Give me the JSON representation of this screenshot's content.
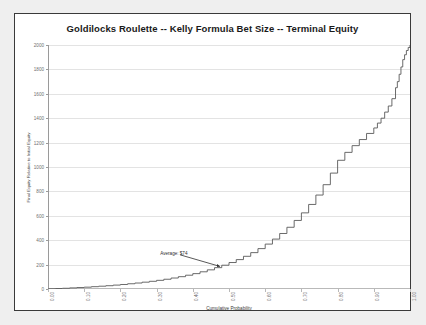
{
  "chart_data": {
    "type": "line",
    "title": "Goldilocks Roulette -- Kelly Formula Bet Size -- Terminal Equity",
    "xlabel": "Cumulative Probability",
    "ylabel": "Final Equity Relative to Initial Equity",
    "xlim": [
      0.0,
      1.0
    ],
    "ylim": [
      0,
      2000
    ],
    "grid": true,
    "legend_position": "none",
    "xtick_labels": [
      "0.00",
      "0.10",
      "0.20",
      "0.30",
      "0.40",
      "0.50",
      "0.60",
      "0.70",
      "0.80",
      "0.90",
      "1.00"
    ],
    "xtick_values": [
      0.0,
      0.1,
      0.2,
      0.3,
      0.4,
      0.5,
      0.6,
      0.7,
      0.8,
      0.9,
      1.0
    ],
    "ytick_labels": [
      "0",
      "200",
      "400",
      "600",
      "800",
      "1000",
      "1200",
      "1400",
      "1600",
      "1800",
      "2000"
    ],
    "ytick_values": [
      0,
      200,
      400,
      600,
      800,
      1000,
      1200,
      1400,
      1600,
      1800,
      2000
    ],
    "series": [
      {
        "name": "Terminal Equity",
        "x": [
          0.0,
          0.02,
          0.04,
          0.06,
          0.08,
          0.1,
          0.12,
          0.14,
          0.16,
          0.18,
          0.2,
          0.22,
          0.24,
          0.26,
          0.28,
          0.3,
          0.32,
          0.34,
          0.36,
          0.38,
          0.4,
          0.42,
          0.44,
          0.46,
          0.48,
          0.5,
          0.52,
          0.54,
          0.56,
          0.58,
          0.6,
          0.62,
          0.64,
          0.66,
          0.68,
          0.7,
          0.72,
          0.74,
          0.76,
          0.78,
          0.8,
          0.82,
          0.84,
          0.86,
          0.88,
          0.9,
          0.91,
          0.92,
          0.93,
          0.94,
          0.95,
          0.96,
          0.965,
          0.97,
          0.975,
          0.98,
          0.985,
          0.99,
          0.995,
          1.0
        ],
        "y": [
          2,
          4,
          6,
          9,
          12,
          15,
          19,
          23,
          27,
          32,
          37,
          43,
          49,
          56,
          63,
          71,
          80,
          90,
          101,
          113,
          126,
          141,
          157,
          175,
          195,
          217,
          241,
          268,
          298,
          331,
          368,
          409,
          455,
          506,
          562,
          624,
          693,
          770,
          855,
          950,
          1055,
          1120,
          1175,
          1225,
          1275,
          1320,
          1360,
          1400,
          1450,
          1500,
          1560,
          1650,
          1700,
          1760,
          1820,
          1880,
          1920,
          1955,
          1980,
          2000
        ]
      }
    ],
    "annotations": [
      {
        "label": "Average: $74",
        "kind": "arrow-callout",
        "text_x": 0.31,
        "text_y": 290,
        "arrow_from_x": 0.365,
        "arrow_from_y": 280,
        "arrow_to_x": 0.475,
        "arrow_to_y": 185
      }
    ],
    "colors": {
      "line": "#595959",
      "gridline": "#e3e3e3",
      "axis": "#9a9a9a",
      "frame": "#3a3a3a",
      "plot_background": "#ffffff",
      "page_background": "#efefef",
      "title_text": "#1a1a1a",
      "tick_text": "#6e6e6e",
      "annotation_text": "#2d2d2d"
    }
  }
}
